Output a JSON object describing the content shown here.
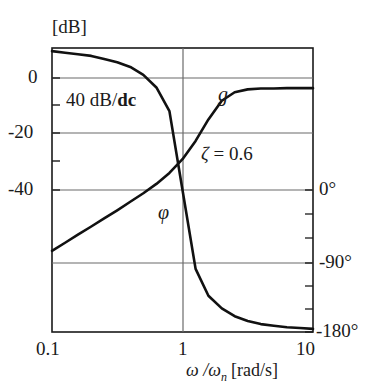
{
  "figure": {
    "name": "bode-plot-second-order-system",
    "background_color": "#ffffff",
    "frame_color": "#1a1a1a",
    "grid_color": "#6b6b6b",
    "curve_color": "#111111"
  },
  "axes": {
    "y_left": {
      "unit_label": "[dB]",
      "tick_labels": [
        "0",
        "-20",
        "-40"
      ],
      "tick_values": [
        0,
        -20,
        -40
      ],
      "minor_tick_values": [
        -10,
        -30
      ],
      "range": [
        -60,
        10
      ]
    },
    "y_right": {
      "tick_labels": [
        "0°",
        "-90°",
        "-180°"
      ],
      "tick_values": [
        0,
        -90,
        -180
      ],
      "minor_tick_values": [
        -30,
        -60,
        -120,
        -150
      ],
      "range": [
        -180,
        0
      ]
    },
    "x_bottom": {
      "title": "ω /ω",
      "title_subscript": "n",
      "title_unit": "[rad/s]",
      "tick_labels": [
        "0.1",
        "1",
        "10"
      ],
      "tick_values": [
        0.1,
        1,
        10
      ],
      "scale": "log"
    }
  },
  "annotations": {
    "slope_prefix": "40 dB/",
    "slope_bold": "dc",
    "gain_curve_label": "g",
    "phase_curve_label": "φ",
    "damping_symbol": "ζ",
    "damping_equals": " = 0.6"
  },
  "chart_data": {
    "type": "line",
    "title": "",
    "xlabel": "ω/ωn [rad/s]",
    "ylabel": "[dB]",
    "xscale": "log",
    "xlim": [
      0.1,
      10
    ],
    "grid": true,
    "legend": "none",
    "damping_ratio": 0.6,
    "low_frequency_slope_db_per_decade": 40,
    "series": [
      {
        "name": "g",
        "axis": "left",
        "ylabel": "[dB]",
        "ylim": [
          -60,
          10
        ],
        "x": [
          0.1,
          0.126,
          0.158,
          0.2,
          0.251,
          0.316,
          0.398,
          0.501,
          0.631,
          0.794,
          1.0,
          1.26,
          1.58,
          2.0,
          2.51,
          3.16,
          3.98,
          5.01,
          6.31,
          7.94,
          10.0
        ],
        "y": [
          -40.0,
          -38.0,
          -36.0,
          -34.0,
          -32.0,
          -30.0,
          -27.9,
          -25.8,
          -23.5,
          -20.8,
          -17.4,
          -12.9,
          -7.6,
          -3.0,
          -0.9,
          -0.2,
          0.0,
          0.0,
          0.1,
          0.1,
          0.1
        ]
      },
      {
        "name": "φ",
        "axis": "right",
        "ylabel": "degrees",
        "ylim": [
          -180,
          0
        ],
        "x": [
          0.1,
          0.126,
          0.158,
          0.2,
          0.251,
          0.316,
          0.398,
          0.501,
          0.631,
          0.794,
          1.0,
          1.26,
          1.58,
          2.0,
          2.51,
          3.16,
          3.98,
          5.01,
          6.31,
          7.94,
          10.0
        ],
        "y": [
          -2.0,
          -3.0,
          -4.0,
          -5.0,
          -7.0,
          -9.0,
          -12.0,
          -17.0,
          -25.0,
          -40.0,
          -90.0,
          -140.0,
          -157.0,
          -165.0,
          -170.0,
          -173.0,
          -175.0,
          -176.0,
          -177.0,
          -177.5,
          -178.0
        ]
      }
    ]
  }
}
